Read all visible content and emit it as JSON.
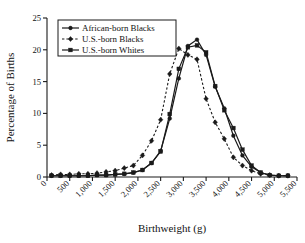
{
  "chart_data": {
    "type": "line",
    "title": "",
    "xlabel": "Birthweight (g)",
    "ylabel": "Percentage of Births",
    "xlim": [
      0,
      5500
    ],
    "ylim": [
      0,
      25
    ],
    "grid": false,
    "legend_position": "top-left",
    "xticks": [
      0,
      500,
      1000,
      1500,
      2000,
      2500,
      3000,
      3500,
      4000,
      4500,
      5000,
      5500
    ],
    "xtick_labels": [
      "0",
      "500",
      "1,000",
      "1,500",
      "2,000",
      "2,500",
      "3,000",
      "3,500",
      "4,000",
      "4,500",
      "5,000",
      "5,500"
    ],
    "yticks": [
      0,
      5,
      10,
      15,
      20,
      25
    ],
    "ytick_labels": [
      "0",
      "5",
      "10",
      "15",
      "20",
      "25"
    ],
    "x": [
      100,
      300,
      500,
      700,
      900,
      1100,
      1300,
      1500,
      1700,
      1900,
      2100,
      2300,
      2500,
      2700,
      2900,
      3100,
      3300,
      3500,
      3700,
      3900,
      4100,
      4300,
      4500,
      4700,
      4900,
      5100,
      5300
    ],
    "series": [
      {
        "name": "African-born Blacks",
        "marker": "circle",
        "line_style": "solid",
        "color": "#1a1a1a",
        "values": [
          0.2,
          0.2,
          0.2,
          0.2,
          0.2,
          0.3,
          0.3,
          0.4,
          0.5,
          0.7,
          1.1,
          2.2,
          4.1,
          9.2,
          15.5,
          20.6,
          21.6,
          19.2,
          14.2,
          10.8,
          6.5,
          3.4,
          1.6,
          0.7,
          0.3,
          0.2,
          0.2
        ]
      },
      {
        "name": "U.S.-born Blacks",
        "marker": "diamond",
        "line_style": "dashed",
        "color": "#1a1a1a",
        "values": [
          0.3,
          0.4,
          0.4,
          0.5,
          0.5,
          0.6,
          0.8,
          1.0,
          1.4,
          1.8,
          3.4,
          5.7,
          9.0,
          16.2,
          20.2,
          19.2,
          18.5,
          12.3,
          8.6,
          6.0,
          3.1,
          1.8,
          1.0,
          0.5,
          0.3,
          0.2,
          0.2
        ]
      },
      {
        "name": "U.S.-born Whites",
        "marker": "square",
        "line_style": "solid",
        "color": "#1a1a1a",
        "values": [
          0.2,
          0.2,
          0.2,
          0.2,
          0.2,
          0.3,
          0.3,
          0.4,
          0.5,
          0.7,
          1.1,
          2.2,
          4.0,
          9.9,
          17.0,
          20.4,
          20.7,
          19.6,
          14.3,
          10.5,
          7.7,
          4.3,
          1.8,
          0.7,
          0.3,
          0.2,
          0.2
        ]
      }
    ]
  }
}
